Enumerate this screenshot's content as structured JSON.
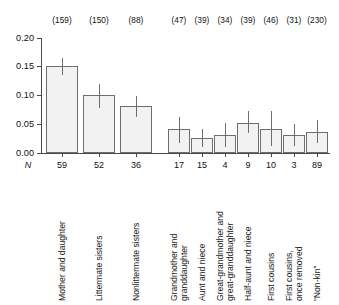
{
  "chart_data": {
    "type": "bar",
    "title": "",
    "xlabel": "",
    "ylabel": "",
    "ylim": [
      0.0,
      0.2
    ],
    "ytick_labels": [
      "0.20",
      "0.15",
      "0.10",
      "0.05",
      "0.00"
    ],
    "ytick_values": [
      0.2,
      0.15,
      0.1,
      0.05,
      0.0
    ],
    "grid": false,
    "legend": "none",
    "n_row_key": "N",
    "error_bar_note": "vertical line through each bar",
    "categories": [
      "Mother and daughter",
      "Littermate sisters",
      "Nonlittermate sisters",
      "Grandmother and granddaughter",
      "Aunt and niece",
      "Great-grandmother and great-granddaughter",
      "Half-aunt and niece",
      "First cousins",
      "First cousins, once removed",
      "“Non-kin”"
    ],
    "category_lines": [
      [
        "Mother and daughter"
      ],
      [
        "Littermate sisters"
      ],
      [
        "Nonlittermate sisters"
      ],
      [
        "Grandmother and",
        "granddaughter"
      ],
      [
        "Aunt and niece"
      ],
      [
        "Great-grandmother and",
        "great-granddaughter"
      ],
      [
        "Half-aunt and niece"
      ],
      [
        "First cousins"
      ],
      [
        "First cousins,",
        "once removed"
      ],
      [
        "“Non-kin”"
      ]
    ],
    "values": [
      0.151,
      0.101,
      0.082,
      0.041,
      0.026,
      0.031,
      0.052,
      0.042,
      0.032,
      0.037
    ],
    "err_low": [
      0.136,
      0.079,
      0.063,
      0.017,
      0.011,
      0.01,
      0.035,
      0.012,
      0.012,
      0.017
    ],
    "err_high": [
      0.166,
      0.12,
      0.099,
      0.063,
      0.041,
      0.052,
      0.073,
      0.073,
      0.05,
      0.058
    ],
    "n_dyads": [
      "59",
      "52",
      "36",
      "17",
      "15",
      "4",
      "9",
      "10",
      "3",
      "89"
    ],
    "n_top_labels": [
      "(159)",
      "(150)",
      "(88)",
      "(47)",
      "(39)",
      "(34)",
      "(39)",
      "(46)",
      "(31)",
      "(230)"
    ],
    "bar_geometry": {
      "x_left": [
        46,
        83,
        120,
        168,
        191,
        214,
        237,
        260,
        283,
        306
      ],
      "width": [
        32,
        32,
        32,
        22,
        22,
        22,
        22,
        22,
        22,
        22
      ]
    },
    "axis_geometry": {
      "y_top_px": 38,
      "y_zero_px": 153,
      "y_value_top": 0.2,
      "x_axis_left_px": 41,
      "x_axis_right_px": 330
    },
    "colors": {
      "bar_fill": "#f2f2f2",
      "bar_stroke": "#6e6e6e",
      "axis": "#4a4a4a",
      "text": "#111111",
      "background": "#ffffff"
    }
  }
}
